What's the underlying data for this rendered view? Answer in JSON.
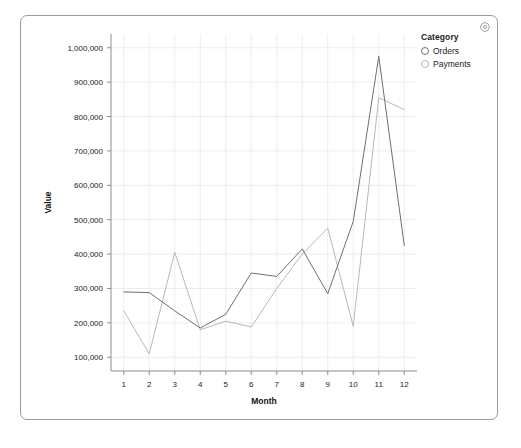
{
  "card": {
    "gear_icon": "gear-icon"
  },
  "legend": {
    "title": "Category",
    "items": [
      {
        "label": "Orders",
        "marker": "circle-marker",
        "color": "#6f6f6f"
      },
      {
        "label": "Payments",
        "marker": "circle-marker",
        "color": "#b9b9b9"
      }
    ]
  },
  "chart_data": {
    "type": "line",
    "title": "",
    "xlabel": "Month",
    "ylabel": "Value",
    "categories": [
      1,
      2,
      3,
      4,
      5,
      6,
      7,
      8,
      9,
      10,
      11,
      12
    ],
    "x": [
      1,
      2,
      3,
      4,
      5,
      6,
      7,
      8,
      9,
      10,
      11,
      12
    ],
    "xtick_labels": [
      "1",
      "2",
      "3",
      "4",
      "5",
      "6",
      "7",
      "8",
      "9",
      "10",
      "11",
      "12"
    ],
    "ytick_labels": [
      "100,000",
      "200,000",
      "300,000",
      "400,000",
      "500,000",
      "600,000",
      "700,000",
      "800,000",
      "900,000",
      "1,000,000"
    ],
    "yticks": [
      100000,
      200000,
      300000,
      400000,
      500000,
      600000,
      700000,
      800000,
      900000,
      1000000
    ],
    "xlim": [
      0.5,
      12.5
    ],
    "ylim": [
      60000,
      1040000
    ],
    "grid": true,
    "legend_position": "right",
    "series": [
      {
        "name": "Orders",
        "color": "#6f6f6f",
        "values": [
          290000,
          288000,
          235000,
          185000,
          225000,
          345000,
          335000,
          415000,
          285000,
          495000,
          975000,
          425000
        ]
      },
      {
        "name": "Payments",
        "color": "#b9b9b9",
        "values": [
          235000,
          110000,
          405000,
          180000,
          205000,
          188000,
          300000,
          400000,
          475000,
          190000,
          855000,
          820000
        ]
      }
    ]
  }
}
